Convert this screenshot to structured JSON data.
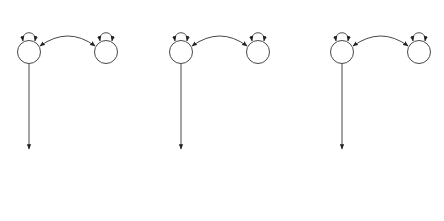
{
  "panels": [
    {
      "offset_x": 0,
      "q1": {
        "label": "Q1",
        "variance": "1.00"
      },
      "q2": {
        "label": "Q2",
        "variance": "1.00"
      },
      "q_covariance": "1.00",
      "c1": {
        "label": "C1",
        "variance": "1.00"
      },
      "path_q1": "q",
      "path_q2": "q",
      "path_c_sib1": "c",
      "path_c_sib2": "c",
      "extra_c_label": "",
      "sib1": {
        "label": "Sib1",
        "variance": "1.00"
      },
      "sib2": {
        "label": "Sib2",
        "variance": "1.00"
      }
    },
    {
      "offset_x": 152,
      "q1": {
        "label": "Q1",
        "variance": "1.00"
      },
      "q2": {
        "label": "Q2",
        "variance": "1.00"
      },
      "q_covariance": "0.50",
      "c1": {
        "label": "C1",
        "variance": "1.00"
      },
      "path_q1": "q",
      "path_q2": "q",
      "path_c_sib1": "c",
      "path_c_sib2": "c",
      "extra_c_label": "",
      "sib1": {
        "label": "Sib1",
        "variance": "1.00"
      },
      "sib2": {
        "label": "Sib2",
        "variance": "1.00"
      }
    },
    {
      "offset_x": 313,
      "q1": {
        "label": "Q1",
        "variance": "1.00"
      },
      "q2": {
        "label": "Q2",
        "variance": "1.00"
      },
      "q_covariance": "0.00",
      "c1": {
        "label": "C1",
        "variance": "1.00"
      },
      "path_q1": "q",
      "path_q2": "q",
      "path_c_sib1": "c",
      "path_c_sib2": "c",
      "extra_c_label": "0.75",
      "sib1": {
        "label": "Sib1",
        "variance": "1.00"
      },
      "sib2": {
        "label": "Sib2",
        "variance": "1.00"
      }
    }
  ]
}
